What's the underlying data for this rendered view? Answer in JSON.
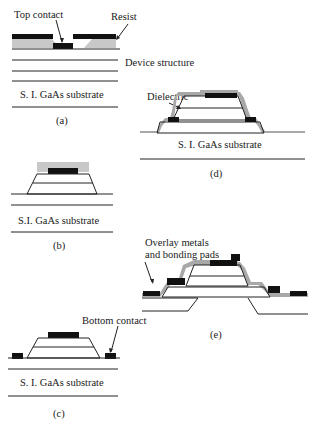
{
  "diagram": {
    "type": "process-flow-cross-sections",
    "panels": [
      {
        "id": "a",
        "caption": "(a)",
        "labels": {
          "top_contact": "Top contact",
          "resist": "Resist",
          "device_structure": "Device structure",
          "substrate": "S. I. GaAs substrate"
        }
      },
      {
        "id": "b",
        "caption": "(b)",
        "labels": {
          "substrate": "S.I.  GaAs substrate"
        }
      },
      {
        "id": "c",
        "caption": "(c)",
        "labels": {
          "bottom_contact": "Bottom contact",
          "substrate": "S. I. GaAs substrate"
        }
      },
      {
        "id": "d",
        "caption": "(d)",
        "labels": {
          "dielectric": "Dielectric",
          "substrate": "S. I. GaAs substrate"
        }
      },
      {
        "id": "e",
        "caption": "(e)",
        "labels": {
          "overlay_line1": "Overlay metals",
          "overlay_line2": "and bonding pads"
        }
      }
    ],
    "colors": {
      "metal": "#111111",
      "resist": "#c8c8c8",
      "dielectric": "#a8a8a8",
      "line": "#222222"
    }
  }
}
